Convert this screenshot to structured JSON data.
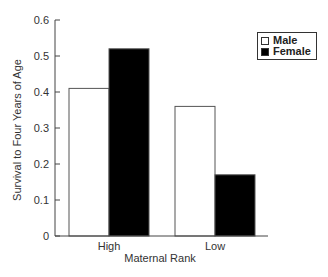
{
  "chart_data": {
    "type": "bar",
    "title": "",
    "xlabel": "Maternal Rank",
    "ylabel": "Survival to Four Years of Age",
    "categories": [
      "High",
      "Low"
    ],
    "series": [
      {
        "name": "Male",
        "values": [
          0.41,
          0.36
        ],
        "color": "#ffffff"
      },
      {
        "name": "Female",
        "values": [
          0.52,
          0.17
        ],
        "color": "#000000"
      }
    ],
    "ylim": [
      0,
      0.6
    ],
    "yticks": [
      "0",
      "0.1",
      "0.2",
      "0.3",
      "0.4",
      "0.5",
      "0.6"
    ],
    "grid": false,
    "legend_position": "top-right"
  },
  "legend": {
    "items": [
      "Male",
      "Female"
    ]
  }
}
